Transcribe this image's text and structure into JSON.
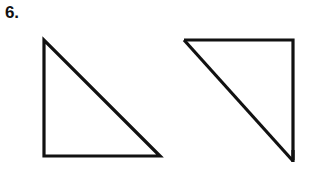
{
  "figure": {
    "background_color": "#ffffff",
    "stroke_color": "#111111",
    "width": 313,
    "height": 176,
    "problem_number": "6.",
    "shapes": [
      {
        "name": "left-triangle",
        "kind": "right-triangle",
        "right_angle_at": "bottom-left",
        "stroke_width": 3.2,
        "fill": "none",
        "points": "44,40 44,156 160,156",
        "vertices": [
          {
            "label": "top-left",
            "x": 44,
            "y": 40
          },
          {
            "label": "bottom-left",
            "x": 44,
            "y": 156
          },
          {
            "label": "bottom-right",
            "x": 160,
            "y": 156
          }
        ],
        "legs": {
          "vertical": 116,
          "horizontal": 116
        }
      },
      {
        "name": "right-triangle",
        "kind": "right-triangle",
        "right_angle_at": "top-right",
        "stroke_width": 3.2,
        "fill": "none",
        "points": "184,40 293,40 293,160",
        "vertices": [
          {
            "label": "top-left",
            "x": 184,
            "y": 40
          },
          {
            "label": "top-right",
            "x": 293,
            "y": 40
          },
          {
            "label": "bottom-right",
            "x": 293,
            "y": 160
          }
        ],
        "legs": {
          "vertical": 120,
          "horizontal": 109
        },
        "overshoot": {
          "name": "bottom-vertex-overshoot",
          "x1": 293,
          "y1": 152,
          "x2": 293,
          "y2": 163
        }
      }
    ]
  }
}
